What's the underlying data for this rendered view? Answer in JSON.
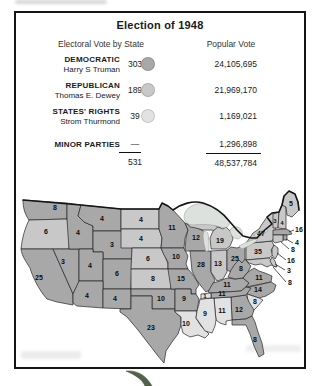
{
  "title": "Election of 1948",
  "legend": {
    "col1_header": "Electoral Vote by State",
    "col2_header": "Popular Vote",
    "rows": [
      {
        "party": "DEMOCRATIC",
        "candidate": "Harry S Truman",
        "electoral": "303",
        "popular": "24,105,695",
        "color": "#a8a8a8"
      },
      {
        "party": "REPUBLICAN",
        "candidate": "Thomas E. Dewey",
        "electoral": "189",
        "popular": "21,969,170",
        "color": "#c8c8c8"
      },
      {
        "party": "STATES' RIGHTS",
        "candidate": "Strom Thurmond",
        "electoral": "39",
        "popular": "1,169,021",
        "color": "#e2e2e2"
      },
      {
        "party": "MINOR PARTIES",
        "candidate": "",
        "electoral": "—",
        "popular": "1,296,898",
        "color": ""
      }
    ],
    "total_electoral": "531",
    "total_popular": "48,537,784"
  },
  "chart_data": {
    "type": "choropleth-map",
    "title": "Election of 1948",
    "columns": [
      "Electoral Vote by State",
      "Popular Vote"
    ],
    "parties": [
      {
        "name": "DEMOCRATIC",
        "candidate": "Harry S Truman",
        "electoral_votes": 303,
        "popular_votes": "24,105,695"
      },
      {
        "name": "REPUBLICAN",
        "candidate": "Thomas E. Dewey",
        "electoral_votes": 189,
        "popular_votes": "21,969,170"
      },
      {
        "name": "STATES' RIGHTS",
        "candidate": "Strom Thurmond",
        "electoral_votes": 39,
        "popular_votes": "1,169,021"
      },
      {
        "name": "MINOR PARTIES",
        "candidate": "",
        "electoral_votes": null,
        "popular_votes": "1,296,898"
      }
    ],
    "totals": {
      "electoral_votes": 531,
      "popular_votes": "48,537,784"
    },
    "state_votes_shown_on_map": {
      "WA": 8,
      "OR": 6,
      "CA": 25,
      "NV": 3,
      "ID": 4,
      "MT": 4,
      "WY": 3,
      "UT": 4,
      "CO": 6,
      "AZ": 4,
      "NM": 4,
      "ND": 4,
      "SD": 4,
      "NE": 6,
      "KS": 8,
      "OK": 10,
      "TX": 23,
      "MN": 11,
      "IA": 10,
      "MO": 15,
      "AR": 9,
      "LA": 10,
      "WI": 12,
      "IL": 28,
      "MI": 19,
      "IN": 13,
      "OH": 25,
      "KY": 11,
      "TN_democratic": 11,
      "TN_states_rights": 1,
      "MS": 9,
      "AL": 11,
      "GA": 12,
      "SC": 8,
      "NC": 14,
      "VA": 11,
      "WV": 8,
      "FL": 8,
      "PA": 35,
      "NY": 47,
      "ME": 5,
      "VT": 3,
      "NH": 4,
      "MA": 16,
      "RI": 4,
      "CT": 8,
      "NJ": 16,
      "DE": 3,
      "MD": 8
    }
  },
  "map": {
    "colors": {
      "d": "#a8a8a8",
      "r": "#c8c8c8",
      "s": "#e2e2e2",
      "lake": "#dde1dd",
      "stroke": "#262626"
    },
    "states": [
      {
        "id": "wa",
        "v": "8",
        "p": "d",
        "lx": 40,
        "ly": 24,
        "d": "M8,14 L52,17 L52,33 L14,34 C9,27 8,20 8,14 Z"
      },
      {
        "id": "or",
        "v": "6",
        "p": "r",
        "lx": 31,
        "ly": 48,
        "d": "M14,34 L52,33 L55,44 L54,63 L6,63 C7,52 10,42 14,34 Z"
      },
      {
        "id": "ca",
        "v": "25",
        "p": "d",
        "lx": 24,
        "ly": 94,
        "d": "M6,63 L38,63 L58,108 L58,119 L42,116 L32,113 C24,104 18,92 15,82 C10,74 7,70 6,63 Z"
      },
      {
        "id": "nv",
        "v": "3",
        "p": "d",
        "lx": 48,
        "ly": 78,
        "d": "M38,63 L64,63 L64,96 L58,108 Z"
      },
      {
        "id": "id",
        "v": "4",
        "p": "d",
        "lx": 63,
        "ly": 49,
        "d": "M52,17 L66,19 L63,30 L69,36 L78,40 L78,63 L54,63 L52,33 Z"
      },
      {
        "id": "mt",
        "v": "4",
        "p": "d",
        "lx": 87,
        "ly": 35,
        "d": "M66,19 L106,23 L106,45 L78,45 L78,40 L69,36 L63,30 Z"
      },
      {
        "id": "wy",
        "v": "3",
        "p": "d",
        "lx": 97,
        "ly": 61,
        "d": "M78,45 L117,45 L117,73 L88,73 L88,66 L78,66 Z"
      },
      {
        "id": "ut",
        "v": "4",
        "p": "d",
        "lx": 75,
        "ly": 82,
        "d": "M64,63 L78,63 L78,66 L88,66 L88,95 L64,95 Z"
      },
      {
        "id": "co",
        "v": "6",
        "p": "d",
        "lx": 102,
        "ly": 90,
        "d": "M88,73 L117,73 L116,103 L88,103 Z"
      },
      {
        "id": "az",
        "v": "4",
        "p": "d",
        "lx": 72,
        "ly": 112,
        "d": "M64,95 L88,95 L88,122 L62,120 L58,117 L58,108 Z"
      },
      {
        "id": "nm",
        "v": "4",
        "p": "d",
        "lx": 100,
        "ly": 115,
        "d": "M88,103 L116,103 L116,123 L88,122 Z"
      },
      {
        "id": "nd",
        "v": "4",
        "p": "r",
        "lx": 126,
        "ly": 36,
        "d": "M106,23 L144,23 L144,43 L106,43 Z"
      },
      {
        "id": "sd",
        "v": "4",
        "p": "r",
        "lx": 126,
        "ly": 55,
        "d": "M106,43 L144,43 L147,52 L146,62 L106,62 Z"
      },
      {
        "id": "ne",
        "v": "6",
        "p": "r",
        "lx": 133,
        "ly": 75,
        "d": "M117,62 L146,62 L150,70 L153,78 L153,83 L116,83 Z"
      },
      {
        "id": "ks",
        "v": "8",
        "p": "r",
        "lx": 138,
        "ly": 95,
        "d": "M116,83 L153,83 L157,88 L156,103 L116,103 Z"
      },
      {
        "id": "ok",
        "v": "10",
        "p": "d",
        "lx": 146,
        "ly": 115,
        "d": "M116,103 L160,103 L160,123 L137,123 L137,110 L116,110 Z"
      },
      {
        "id": "tx",
        "v": "23",
        "p": "d",
        "lx": 136,
        "ly": 144,
        "d": "M116,110 L137,110 L137,123 L160,123 L160,126 L166,131 L166,139 L163,148 L157,156 L151,165 L149,177 L143,170 L133,157 L123,144 L112,131 L105,126 L105,123 L116,123 Z"
      },
      {
        "id": "mn",
        "v": "11",
        "p": "d",
        "lx": 157,
        "ly": 44,
        "d": "M144,23 L147,17 L153,20 L158,24 L170,37 L173,44 L170,52 L169,62 L146,62 L147,52 L144,43 Z"
      },
      {
        "id": "ia",
        "v": "10",
        "p": "d",
        "lx": 161,
        "ly": 73,
        "d": "M146,62 L169,62 L173,70 L171,78 L173,83 L153,83 L153,76 L149,69 Z"
      },
      {
        "id": "mo",
        "v": "15",
        "p": "d",
        "lx": 166,
        "ly": 95,
        "d": "M153,83 L173,83 C178,88 182,95 184,99 L181,103 L181,108 L176,108 L176,103 L156,103 Z"
      },
      {
        "id": "ar",
        "v": "9",
        "p": "d",
        "lx": 169,
        "ly": 115,
        "d": "M160,103 L176,103 L176,108 L181,108 L184,113 L182,125 L160,125 Z"
      },
      {
        "id": "la",
        "v": "10",
        "p": "s",
        "lx": 171,
        "ly": 140,
        "d": "M160,125 L182,125 L181,132 L186,140 L194,148 L190,152 L183,149 L175,151 L168,147 L166,139 L166,131 L160,126 Z"
      },
      {
        "id": "wi",
        "v": "12",
        "p": "d",
        "lx": 181,
        "ly": 54,
        "d": "M170,37 L176,40 L183,42 L190,46 L193,52 L192,58 L193,65 L170,65 L171,52 L173,44 Z"
      },
      {
        "id": "il",
        "v": "28",
        "p": "d",
        "lx": 186,
        "ly": 81,
        "d": "M175,65 L196,65 L196,86 L200,94 L196,103 L191,106 L186,100 L181,93 L177,85 L176,75 Z"
      },
      {
        "id": "mi-upper",
        "v": "",
        "p": "r",
        "lx": 0,
        "ly": 0,
        "d": "M172,37 L181,33 L190,35 L199,39 L206,42 L203,45 L196,44 L188,44 L181,42 L175,41 Z"
      },
      {
        "id": "mi",
        "v": "19",
        "p": "r",
        "lx": 205,
        "ly": 57,
        "d": "M196,62 L195,52 L198,45 L203,41 L208,43 L211,41 L216,46 L218,53 L215,60 L211,63 L196,63 Z"
      },
      {
        "id": "in",
        "v": "13",
        "p": "r",
        "lx": 203,
        "ly": 80,
        "d": "M196,65 L212,64 L212,86 L208,93 L202,95 L198,89 L196,86 Z"
      },
      {
        "id": "oh",
        "v": "25",
        "p": "d",
        "lx": 220,
        "ly": 75,
        "d": "M212,64 L216,61 L222,62 L229,59 L230,62 L230,80 L226,86 L221,89 L216,86 L212,84 Z"
      },
      {
        "id": "ky",
        "v": "11",
        "p": "d",
        "lx": 212,
        "ly": 101,
        "d": "M193,106 L198,97 L205,95 L212,92 L220,93 L228,92 L234,97 L231,101 L226,105 L196,107 Z"
      },
      {
        "id": "wv",
        "v": "8",
        "p": "d",
        "lx": 226,
        "ly": 85,
        "d": "M213,91 L216,84 L220,78 L224,74 L227,77 L230,73 L233,77 L236,80 L233,86 L228,92 L220,93 Z"
      },
      {
        "id": "va",
        "v": "11",
        "p": "d",
        "lx": 244,
        "ly": 94,
        "d": "M234,97 L228,92 L233,86 L239,82 L244,85 L250,87 L257,90 L256,96 L231,101 Z"
      },
      {
        "id": "nc",
        "v": "14",
        "p": "d",
        "lx": 243,
        "ly": 106,
        "d": "M230,102 L256,96 L261,99 L259,105 L251,110 L244,112 L232,108 Z"
      },
      {
        "id": "sc",
        "v": "8",
        "p": "s",
        "lx": 240,
        "ly": 118,
        "d": "M232,108 L244,112 L248,114 L242,121 L236,127 L233,116 Z"
      },
      {
        "id": "ga",
        "v": "12",
        "p": "d",
        "lx": 224,
        "ly": 126,
        "d": "M216,111 L231,109 L234,116 L239,124 L237,130 L231,133 L217,134 Z"
      },
      {
        "id": "al",
        "v": "11",
        "p": "s",
        "lx": 207,
        "ly": 127,
        "d": "M199,112 L216,111 L217,134 L211,135 L211,139 L205,137 L201,134 L200,124 Z"
      },
      {
        "id": "ms",
        "v": "9",
        "p": "s",
        "lx": 190,
        "ly": 130,
        "d": "M185,113 L199,112 L200,124 L201,134 L200,140 L197,147 L190,145 L186,139 L181,132 L182,125 L184,118 Z"
      },
      {
        "id": "tn",
        "v": "11",
        "p": "d",
        "lx": 207,
        "ly": 110,
        "d": "M196,107 L226,105 L231,101 L236,102 L231,109 L216,111 L199,112 L196,112 Z"
      },
      {
        "id": "tn-west",
        "v": "1",
        "p": "s",
        "lx": 190,
        "ly": 112,
        "fs": 6,
        "d": "M186,108 L196,107 L196,112 L186,113 Z"
      },
      {
        "id": "fl",
        "v": "8",
        "p": "d",
        "lx": 240,
        "ly": 156,
        "d": "M217,134 L231,133 L237,130 L240,136 L243,146 L247,157 L249,168 L244,171 L239,160 L235,148 L231,139 L224,139 L217,139 Z"
      },
      {
        "id": "pa",
        "v": "35",
        "p": "r",
        "lx": 243,
        "ly": 68,
        "d": "M231,61 L236,57 L257,55 L259,60 L256,64 L258,69 L254,72 L231,74 Z"
      },
      {
        "id": "ny",
        "v": "47",
        "p": "r",
        "lx": 246,
        "ly": 50,
        "d": "M229,60 L234,53 L238,47 L244,43 L247,38 L252,31 L257,27 L260,30 L259,38 L261,44 L263,48 L259,52 L257,55 L236,57 L231,61 Z"
      },
      {
        "id": "md",
        "v": "",
        "p": "r",
        "lx": 0,
        "ly": 0,
        "d": "M231,74 L254,72 L258,76 L261,81 L256,79 L252,81 L246,78 L240,79 L234,77 Z"
      },
      {
        "id": "de",
        "v": "",
        "p": "r",
        "lx": 0,
        "ly": 0,
        "d": "M257,71 L260,75 L262,81 L258,80 L255,75 Z"
      },
      {
        "id": "nj",
        "v": "",
        "p": "r",
        "lx": 0,
        "ly": 0,
        "d": "M259,59 L263,62 L263,68 L260,73 L257,69 L257,63 Z"
      },
      {
        "id": "vt",
        "v": "3",
        "p": "r",
        "lx": 260,
        "ly": 37,
        "fs": 5.5,
        "d": "M258,28 L264,26 L263,42 L258,42 Z"
      },
      {
        "id": "nh",
        "v": "4",
        "p": "r",
        "lx": 267,
        "ly": 39,
        "fs": 5.5,
        "d": "M264,26 L267,19 L271,21 L271,43 L263,42 Z"
      },
      {
        "id": "me",
        "v": "5",
        "p": "r",
        "lx": 276,
        "ly": 20,
        "d": "M267,19 L269,10 L274,5 L280,8 L283,16 L284,24 L277,31 L272,29 L271,21 Z"
      },
      {
        "id": "ma",
        "v": "",
        "p": "d",
        "lx": 0,
        "ly": 0,
        "d": "M258,44 L271,43 L275,45 L277,48 L272,49 L258,49 Z"
      },
      {
        "id": "ri",
        "v": "",
        "p": "d",
        "lx": 0,
        "ly": 0,
        "d": "M268,49 L272,49 L272,54 L268,54 Z"
      },
      {
        "id": "ct",
        "v": "",
        "p": "r",
        "lx": 0,
        "ly": 0,
        "d": "M258,49 L268,49 L268,55 L260,57 L258,55 Z"
      }
    ],
    "lakes": [
      {
        "id": "lake-superior",
        "d": "M169,30 C170,22 180,16 190,18 C200,20 210,27 214,35 C216,40 211,43 205,41 C197,38 186,38 178,39 C172,39 169,35 169,30 Z"
      },
      {
        "id": "lake-michigan",
        "d": "M189,44 L193,47 L194,56 L194,64 L191,66 L189,58 L188,50 Z"
      },
      {
        "id": "lake-huron",
        "d": "M215,44 C218,39 225,40 227,45 C228,49 226,53 222,53 C218,52 215,48 215,44 Z"
      },
      {
        "id": "lake-erie",
        "d": "M224,60 L232,56 L240,53 L242,55 L234,60 L227,63 Z"
      },
      {
        "id": "lake-ontario",
        "d": "M239,49 L245,45 L252,43 L253,45 L246,49 L241,51 Z"
      }
    ],
    "canada_border": "M8,14 L66,19 L106,23 L144,23 L147,17 L153,20 L158,24 C166,18 178,14 188,17 C198,20 208,27 215,36 L222,44 L228,50 L236,52 L242,52 C246,47 252,42 257,38 L252,31 L257,27 L264,26 L267,19 L269,10 L274,5 L280,8 L283,16 L284,24",
    "callouts": [
      {
        "id": "ma",
        "t": "16",
        "x": 284,
        "y": 46,
        "x1": 279,
        "y1": 44,
        "x2": 274,
        "y2": 46
      },
      {
        "id": "ri",
        "t": "4",
        "x": 282,
        "y": 59,
        "x1": 278,
        "y1": 57,
        "x2": 271,
        "y2": 53
      },
      {
        "id": "ct",
        "t": "8",
        "x": 278,
        "y": 66,
        "x1": 274,
        "y1": 63,
        "x2": 266,
        "y2": 56
      },
      {
        "id": "nj",
        "t": "16",
        "x": 276,
        "y": 77,
        "x1": 271,
        "y1": 74,
        "x2": 262,
        "y2": 67
      },
      {
        "id": "de",
        "t": "3",
        "x": 274,
        "y": 87,
        "x1": 270,
        "y1": 84,
        "x2": 260,
        "y2": 78
      },
      {
        "id": "md",
        "t": "8",
        "x": 275,
        "y": 99,
        "x1": 271,
        "y1": 96,
        "x2": 258,
        "y2": 81
      }
    ]
  }
}
